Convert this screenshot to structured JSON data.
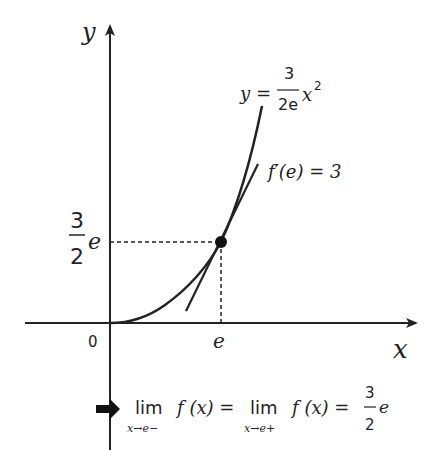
{
  "diagram": {
    "axis_labels": {
      "x": "x",
      "y": "y"
    },
    "origin_label": "0",
    "x_tick_label": "e",
    "y_tick_label": {
      "numerator": "3",
      "denominator": "2",
      "suffix": "e"
    },
    "curve_label": {
      "lhs": "y =",
      "numerator": "3",
      "denominator": "2e",
      "var": "x",
      "exp": "2"
    },
    "tangent_label": "f′(e) = 3",
    "conclusion": {
      "arrow": "➡",
      "lim1": "lim",
      "sub1": "x→e−",
      "f1": "f (x) =",
      "lim2": "lim",
      "sub2": "x→e+",
      "f2": "f (x) =",
      "numerator": "3",
      "denominator": "2",
      "suffix": "e"
    },
    "colors": {
      "ink": "#222222",
      "background": "#ffffff"
    }
  }
}
